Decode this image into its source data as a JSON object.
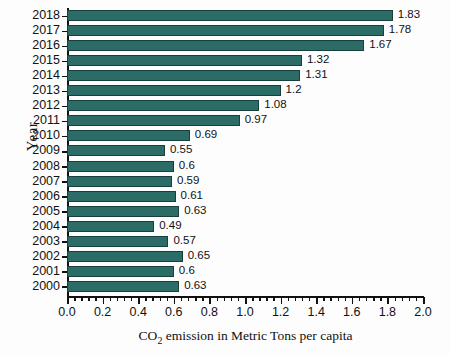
{
  "chart_data": {
    "type": "bar",
    "orientation": "horizontal",
    "title": "",
    "xlabel_prefix": "CO",
    "xlabel_sub": "2",
    "xlabel_suffix": " emission in Metric Tons per capita",
    "ylabel": "Year",
    "xlim": [
      0.0,
      2.0
    ],
    "xticks": [
      "0.0",
      "0.2",
      "0.4",
      "0.6",
      "0.8",
      "1.0",
      "1.2",
      "1.4",
      "1.6",
      "1.8",
      "2.0"
    ],
    "xtick_values": [
      0.0,
      0.2,
      0.4,
      0.6,
      0.8,
      1.0,
      1.2,
      1.4,
      1.6,
      1.8,
      2.0
    ],
    "minor_ticks_per_interval": 4,
    "grid": false,
    "legend": "none",
    "bar_color": "#2c6c67",
    "bar_edge_color": "#173f3c",
    "categories": [
      "2018",
      "2017",
      "2016",
      "2015",
      "2014",
      "2013",
      "2012",
      "2011",
      "2010",
      "2009",
      "2008",
      "2007",
      "2006",
      "2005",
      "2004",
      "2003",
      "2002",
      "2001",
      "2000"
    ],
    "values": [
      1.83,
      1.78,
      1.67,
      1.32,
      1.31,
      1.2,
      1.08,
      0.97,
      0.69,
      0.55,
      0.6,
      0.59,
      0.61,
      0.63,
      0.49,
      0.57,
      0.65,
      0.6,
      0.63
    ],
    "data_labels": [
      "1.83",
      "1.78",
      "1.67",
      "1.32",
      "1.31",
      "1.2",
      "1.08",
      "0.97",
      "0.69",
      "0.55",
      "0.6",
      "0.59",
      "0.61",
      "0.63",
      "0.49",
      "0.57",
      "0.65",
      "0.6",
      "0.63"
    ]
  }
}
